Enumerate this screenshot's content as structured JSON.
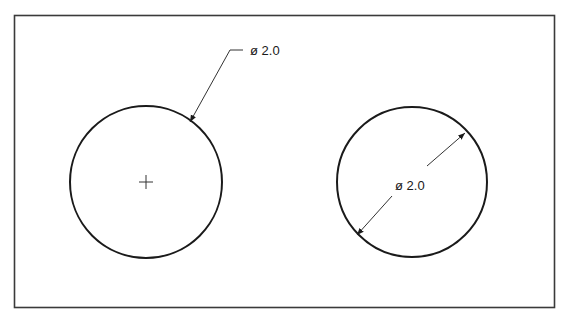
{
  "diagram": {
    "type": "engineering-drawing",
    "frame": {
      "x": 14,
      "y": 15,
      "width": 540,
      "height": 292,
      "stroke": "#3a3a3a"
    },
    "circles": [
      {
        "id": "left-circle",
        "cx": 146,
        "cy": 182,
        "r": 76,
        "center_mark": true,
        "dimension": {
          "style": "leader",
          "label": "ø 2.0",
          "arrow_tip": [
            190,
            122
          ],
          "elbow": [
            230,
            50
          ],
          "shoulder_end": [
            243,
            50
          ],
          "label_pos": [
            250,
            55
          ]
        }
      },
      {
        "id": "right-circle",
        "cx": 412,
        "cy": 182,
        "r": 75,
        "center_mark": false,
        "dimension": {
          "style": "diametral",
          "label": "ø 2.0",
          "arrow_tip_a": [
            357,
            235
          ],
          "arrow_tip_b": [
            465,
            133
          ],
          "label_pos": [
            395,
            190
          ]
        }
      }
    ],
    "colors": {
      "line": "#1a1a1a",
      "background": "#ffffff"
    }
  }
}
